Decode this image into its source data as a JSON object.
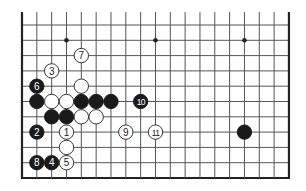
{
  "diagram": {
    "board": {
      "columns": 19,
      "visible_rows": 11,
      "origin_x": 22,
      "origin_y": 25,
      "spacing_x": 14.83,
      "spacing_y": 15.3,
      "top_extension": 13,
      "edges": {
        "left": true,
        "right": true,
        "bottom": true,
        "top": false
      },
      "line_color": "#555555",
      "edge_color": "#222222",
      "star_points": [
        {
          "col": 3,
          "row": 1
        },
        {
          "col": 9,
          "row": 1
        },
        {
          "col": 15,
          "row": 1
        }
      ]
    },
    "stone_radius": 7.2,
    "colors": {
      "black": "#1a1a1a",
      "white": "#ffffff",
      "white_stroke": "#222222",
      "black_label": "#ffffff",
      "white_label": "#222222"
    },
    "stones": [
      {
        "color": "white",
        "col": 3,
        "row": 7,
        "label": "1"
      },
      {
        "color": "black",
        "col": 1,
        "row": 7,
        "label": "2"
      },
      {
        "color": "white",
        "col": 2,
        "row": 3,
        "label": "3"
      },
      {
        "color": "black",
        "col": 2,
        "row": 9,
        "label": "4"
      },
      {
        "color": "white",
        "col": 3,
        "row": 9,
        "label": "5"
      },
      {
        "color": "black",
        "col": 1,
        "row": 4,
        "label": "6"
      },
      {
        "color": "white",
        "col": 4,
        "row": 2,
        "label": "7"
      },
      {
        "color": "black",
        "col": 1,
        "row": 9,
        "label": "8"
      },
      {
        "color": "white",
        "col": 7,
        "row": 7,
        "label": "9"
      },
      {
        "color": "black",
        "col": 8,
        "row": 5,
        "label": "10"
      },
      {
        "color": "white",
        "col": 9,
        "row": 7,
        "label": "11"
      },
      {
        "color": "white",
        "col": 4,
        "row": 4,
        "label": ""
      },
      {
        "color": "black",
        "col": 1,
        "row": 5,
        "label": ""
      },
      {
        "color": "white",
        "col": 2,
        "row": 5,
        "label": ""
      },
      {
        "color": "white",
        "col": 3,
        "row": 5,
        "label": ""
      },
      {
        "color": "black",
        "col": 4,
        "row": 5,
        "label": ""
      },
      {
        "color": "black",
        "col": 5,
        "row": 5,
        "label": ""
      },
      {
        "color": "black",
        "col": 6,
        "row": 5,
        "label": ""
      },
      {
        "color": "black",
        "col": 2,
        "row": 6,
        "label": ""
      },
      {
        "color": "black",
        "col": 3,
        "row": 6,
        "label": ""
      },
      {
        "color": "white",
        "col": 4,
        "row": 6,
        "label": ""
      },
      {
        "color": "white",
        "col": 5,
        "row": 6,
        "label": ""
      },
      {
        "color": "white",
        "col": 3,
        "row": 8,
        "label": ""
      },
      {
        "color": "black",
        "col": 15,
        "row": 7,
        "label": ""
      }
    ]
  }
}
